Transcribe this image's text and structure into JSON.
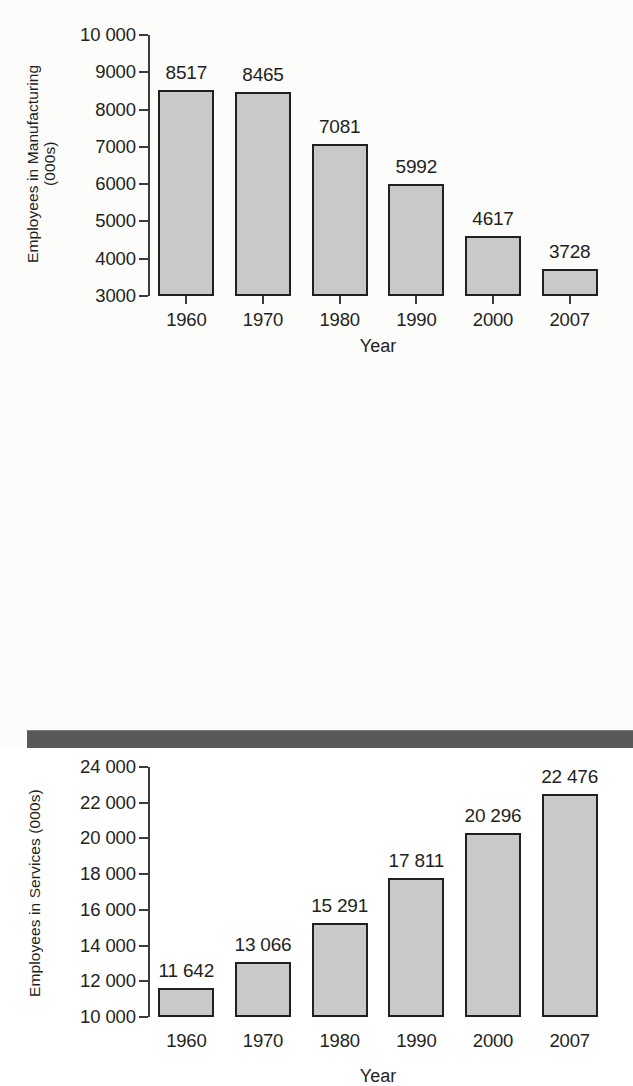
{
  "chart_data": [
    {
      "id": "manufacturing",
      "type": "bar",
      "title": "",
      "xlabel": "Year",
      "ylabel": "Employees in Manufacturing\n(000s)",
      "categories": [
        "1960",
        "1970",
        "1980",
        "1990",
        "2000",
        "2007"
      ],
      "values": [
        8517,
        8465,
        7081,
        5992,
        4617,
        3728
      ],
      "value_labels": [
        "8517",
        "8465",
        "7081",
        "5992",
        "4617",
        "3728"
      ],
      "ylim": [
        3000,
        10000
      ],
      "yticks": [
        10000,
        9000,
        8000,
        7000,
        6000,
        5000,
        4000,
        3000
      ],
      "ytick_labels": [
        "10 000",
        "9000",
        "8000",
        "7000",
        "6000",
        "5000",
        "4000",
        "3000"
      ],
      "grid": false,
      "legend": "none",
      "bar_fill": "#c9c9c9",
      "bar_edge": "#221f1f"
    },
    {
      "id": "services",
      "type": "bar",
      "title": "",
      "xlabel": "Year",
      "ylabel": "Employees in Services (000s)",
      "categories": [
        "1960",
        "1970",
        "1980",
        "1990",
        "2000",
        "2007"
      ],
      "values": [
        11642,
        13066,
        15291,
        17811,
        20296,
        22476
      ],
      "value_labels": [
        "11 642",
        "13 066",
        "15 291",
        "17 811",
        "20 296",
        "22 476"
      ],
      "ylim": [
        10000,
        24000
      ],
      "yticks": [
        24000,
        22000,
        20000,
        18000,
        16000,
        14000,
        12000,
        10000
      ],
      "ytick_labels": [
        "24 000",
        "22 000",
        "20 000",
        "18 000",
        "16 000",
        "14 000",
        "12 000",
        "10 000"
      ],
      "grid": false,
      "legend": "none",
      "bar_fill": "#c9c9c9",
      "bar_edge": "#221f1f"
    }
  ],
  "footer": {
    "band_color": "#595959"
  }
}
